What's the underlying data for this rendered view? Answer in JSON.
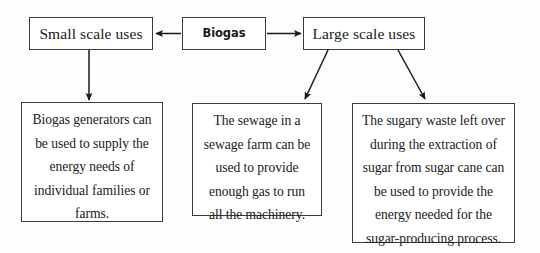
{
  "diagram": {
    "type": "flowchart",
    "background_color": "#fdfdfd",
    "line_color": "#1a1a1a",
    "box_border_color": "#3a3a3a",
    "box_fill_color": "#ffffff"
  },
  "nodes": {
    "biogas": {
      "label": "Biogas"
    },
    "small_scale": {
      "label": "Small scale uses"
    },
    "large_scale": {
      "label": "Large scale uses"
    },
    "detail_small_scale": {
      "label": "Biogas generators can\nbe used to supply the\nenergy needs of\nindividual families or\nfarms."
    },
    "detail_sewage": {
      "label": "The sewage in a\nsewage farm can be\nused to provide\nenough gas to run\nall the machinery."
    },
    "detail_sugar": {
      "label": "The sugary waste left over\nduring the extraction of\nsugar from sugar cane can\nbe used to provide the\nenergy needed for the\nsugar-producing process."
    }
  },
  "connectors": [
    {
      "name": "biogas-to-small-scale",
      "from": "biogas",
      "to": "small_scale",
      "direction": "left"
    },
    {
      "name": "biogas-to-large-scale",
      "from": "biogas",
      "to": "large_scale",
      "direction": "right"
    },
    {
      "name": "small-scale-to-detail",
      "from": "small_scale",
      "to": "detail_small_scale",
      "direction": "down"
    },
    {
      "name": "large-scale-to-sewage",
      "from": "large_scale",
      "to": "detail_sewage",
      "direction": "down-left"
    },
    {
      "name": "large-scale-to-sugar",
      "from": "large_scale",
      "to": "detail_sugar",
      "direction": "down-right"
    }
  ]
}
